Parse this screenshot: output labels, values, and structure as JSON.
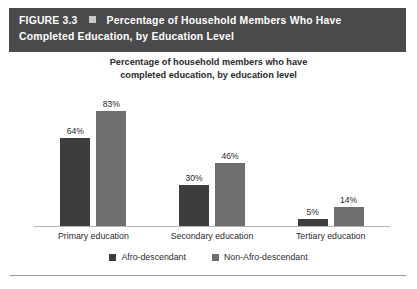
{
  "figure": {
    "number_label": "FIGURE 3.3",
    "bullet_icon": "square-bullet-icon",
    "title_line1": "Percentage of Household Members Who Have",
    "title_line2": "Completed Education, by Education Level",
    "header_bg": "#4a4a4c",
    "header_text_color": "#ffffff"
  },
  "chart_data": {
    "type": "bar",
    "title": "Percentage of household members who have completed education, by education level",
    "title_line1": "Percentage of household members who have",
    "title_line2": "completed education, by education level",
    "xlabel": "",
    "ylabel": "",
    "ylim": [
      0,
      100
    ],
    "grid": false,
    "legend_position": "bottom",
    "categories": [
      "Primary education",
      "Secondary education",
      "Tertiary education"
    ],
    "series": [
      {
        "name": "Afro-descendant",
        "color": "#3d3d3f",
        "values": [
          64,
          30,
          5
        ],
        "labels": [
          "64%",
          "30%",
          "5%"
        ]
      },
      {
        "name": "Non-Afro-descendant",
        "color": "#6e6e70",
        "values": [
          83,
          46,
          14
        ],
        "labels": [
          "83%",
          "46%",
          "14%"
        ]
      }
    ]
  }
}
